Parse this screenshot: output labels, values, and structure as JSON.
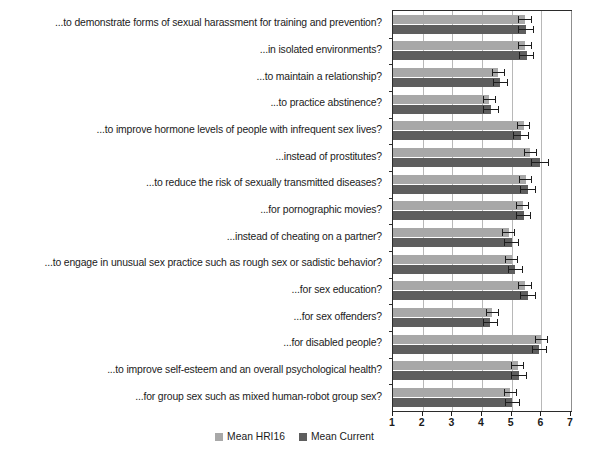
{
  "chart_data": {
    "type": "bar",
    "orientation": "horizontal",
    "title": "",
    "subtitle": "",
    "xlabel": "",
    "ylabel": "",
    "xlim": [
      1,
      7
    ],
    "xticks": [
      1,
      2,
      3,
      4,
      5,
      6,
      7
    ],
    "xtick_labels": [
      "1",
      "2",
      "3",
      "4",
      "5",
      "6",
      "7"
    ],
    "grid": true,
    "grid_axis": "x",
    "legend_position": "bottom-center",
    "error_bars": true,
    "categories": [
      "...to demonstrate forms of sexual harassment for training and prevention?",
      "...in isolated environments?",
      "...to maintain a relationship?",
      "...to practice abstinence?",
      "...to improve hormone levels of people with infrequent sex lives?",
      "...instead of prostitutes?",
      "...to reduce the risk of sexually transmitted diseases?",
      "...for pornographic movies?",
      "...instead of cheating on a partner?",
      "...to engage in unusual sex practice such as rough sex or sadistic behavior?",
      "...for sex education?",
      "...for sex offenders?",
      "...for disabled people?",
      "...to improve self-esteem and an overall psychological health?",
      "...for group sex such as mixed human-robot group sex?"
    ],
    "series": [
      {
        "name": "Mean HRI16",
        "color": "#a8a8a8",
        "values": [
          5.45,
          5.45,
          4.55,
          4.25,
          5.4,
          5.62,
          5.48,
          5.38,
          4.9,
          5.0,
          5.45,
          4.35,
          6.0,
          5.2,
          4.95
        ],
        "errors": [
          0.22,
          0.22,
          0.22,
          0.22,
          0.22,
          0.22,
          0.22,
          0.22,
          0.22,
          0.22,
          0.22,
          0.22,
          0.22,
          0.22,
          0.22
        ]
      },
      {
        "name": "Mean Current",
        "color": "#5e5e5e",
        "values": [
          5.48,
          5.5,
          4.62,
          4.3,
          5.32,
          5.95,
          5.55,
          5.4,
          5.0,
          5.12,
          5.55,
          4.28,
          5.93,
          5.25,
          5.02
        ],
        "errors": [
          0.26,
          0.26,
          0.26,
          0.26,
          0.26,
          0.3,
          0.26,
          0.26,
          0.26,
          0.26,
          0.26,
          0.26,
          0.26,
          0.26,
          0.26
        ]
      }
    ],
    "legend": [
      {
        "label": "Mean HRI16",
        "color": "#a8a8a8"
      },
      {
        "label": "Mean Current",
        "color": "#5e5e5e"
      }
    ]
  }
}
